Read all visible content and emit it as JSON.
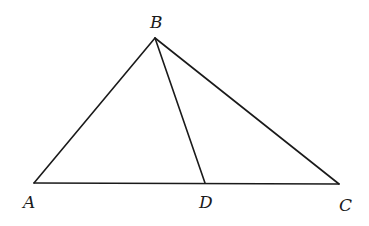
{
  "figure": {
    "type": "triangle-with-cevian",
    "points": {
      "A": {
        "label": "A",
        "x": 34,
        "y": 183
      },
      "B": {
        "label": "B",
        "x": 155,
        "y": 38
      },
      "C": {
        "label": "C",
        "x": 339,
        "y": 184
      },
      "D": {
        "label": "D",
        "x": 205,
        "y": 183
      }
    },
    "segments": [
      "AB",
      "BC",
      "AC",
      "BD"
    ],
    "labels": {
      "A": "A",
      "B": "B",
      "C": "C",
      "D": "D"
    },
    "stroke_color": "#1a1a1a"
  }
}
